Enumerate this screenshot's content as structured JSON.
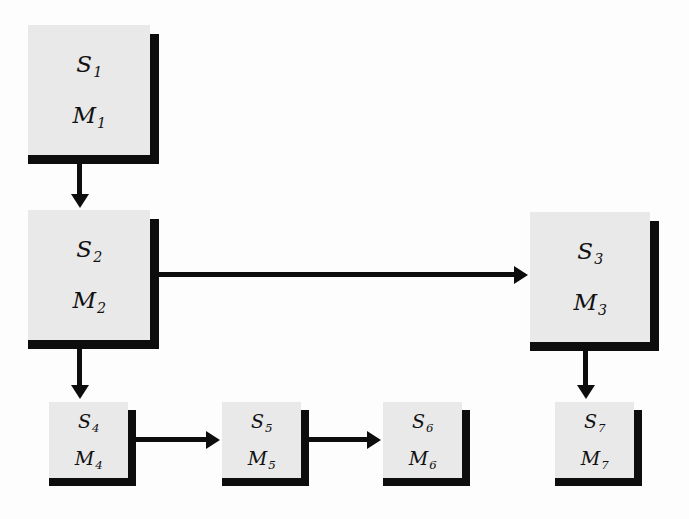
{
  "diagram": {
    "background_color": "#fdfdfd",
    "box_fill_color": "#e9e9e9",
    "shadow_color": "#0d0d0d",
    "line_color": "#0d0d0d",
    "nodes": [
      {
        "id": "n1",
        "state": "S",
        "state_sub": "1",
        "module": "M",
        "module_sub": "1",
        "size": "big",
        "x": 28,
        "y": 25,
        "w": 122,
        "h": 130
      },
      {
        "id": "n2",
        "state": "S",
        "state_sub": "2",
        "module": "M",
        "module_sub": "2",
        "size": "big",
        "x": 28,
        "y": 210,
        "w": 122,
        "h": 130
      },
      {
        "id": "n3",
        "state": "S",
        "state_sub": "3",
        "module": "M",
        "module_sub": "3",
        "size": "big",
        "x": 530,
        "y": 212,
        "w": 120,
        "h": 130
      },
      {
        "id": "n4",
        "state": "S",
        "state_sub": "4",
        "module": "M",
        "module_sub": "4",
        "size": "small",
        "x": 49,
        "y": 402,
        "w": 79,
        "h": 76
      },
      {
        "id": "n5",
        "state": "S",
        "state_sub": "5",
        "module": "M",
        "module_sub": "5",
        "size": "small",
        "x": 222,
        "y": 402,
        "w": 79,
        "h": 76
      },
      {
        "id": "n6",
        "state": "S",
        "state_sub": "6",
        "module": "M",
        "module_sub": "6",
        "size": "small",
        "x": 383,
        "y": 402,
        "w": 79,
        "h": 76
      },
      {
        "id": "n7",
        "state": "S",
        "state_sub": "7",
        "module": "M",
        "module_sub": "7",
        "size": "small",
        "x": 555,
        "y": 402,
        "w": 79,
        "h": 76
      }
    ],
    "edges": [
      {
        "id": "e1",
        "from": "n1",
        "to": "n2",
        "direction": "down",
        "label": ""
      },
      {
        "id": "e2",
        "from": "n2",
        "to": "n3",
        "direction": "right",
        "label": ""
      },
      {
        "id": "e3",
        "from": "n2",
        "to": "n4",
        "direction": "down",
        "label": ""
      },
      {
        "id": "e4",
        "from": "n4",
        "to": "n5",
        "direction": "right",
        "label": ""
      },
      {
        "id": "e5",
        "from": "n5",
        "to": "n6",
        "direction": "right",
        "label": ""
      },
      {
        "id": "e6",
        "from": "n3",
        "to": "n7",
        "direction": "down",
        "label": ""
      }
    ]
  }
}
